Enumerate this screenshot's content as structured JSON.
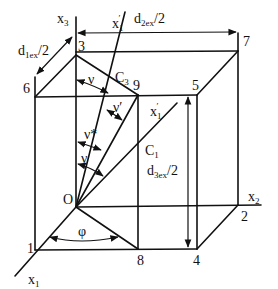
{
  "diagram": {
    "axes": {
      "x1": "x",
      "x1_sub": "1",
      "x2": "x",
      "x2_sub": "2",
      "x3": "x",
      "x3_sub": "3",
      "x1_prime_top": "x",
      "x1_prime_top_sub": "1",
      "prime": "′",
      "x1_prime_mid": "x",
      "x1_prime_mid_sub": "1"
    },
    "origin": "O",
    "vertices": {
      "v1": "1",
      "v2": "2",
      "v3": "3",
      "v4": "4",
      "v5": "5",
      "v6": "6",
      "v7": "7",
      "v8": "8",
      "v9": "9"
    },
    "points": {
      "c1": "C",
      "c1_sub": "1",
      "c3": "C",
      "c3_sub": "3"
    },
    "dimensions": {
      "d1": "d",
      "d1_sub": "1ex",
      "d1_tail": "/2",
      "d2": "d",
      "d2_sub": "2ex",
      "d2_tail": "/2",
      "d3": "d",
      "d3_sub": "3ex",
      "d3_tail": "/2"
    },
    "angles": {
      "nu_top": "ν",
      "nu_prime": "ν′",
      "nu_star": "ν*",
      "nu_bottom": "ν",
      "phi": "φ"
    }
  }
}
